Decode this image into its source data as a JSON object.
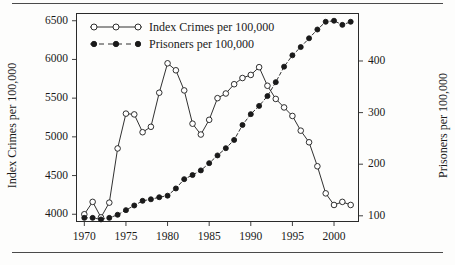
{
  "figure": {
    "has_top_rule": true,
    "has_bottom_rule": true,
    "rule_color": "#4a4a4a",
    "frame_color": "#2a2a2a"
  },
  "chart_data": {
    "type": "line",
    "title": "",
    "subtitle": "",
    "xlabel": "",
    "ylabel": "Index Crimes per 100,000",
    "ylabel_right": "Prisoners per 100,000",
    "grid": false,
    "legend_position": "top-left-inside",
    "xlim": [
      1969,
      2003
    ],
    "ylim": [
      3900,
      6600
    ],
    "ylim_right": [
      88,
      493
    ],
    "xticks": [
      1970,
      1975,
      1980,
      1985,
      1990,
      1995,
      2000
    ],
    "xtick_labels": [
      "1970",
      "1975",
      "1980",
      "1985",
      "1990",
      "1995",
      "2000"
    ],
    "yticks": [
      4000,
      4500,
      5000,
      5500,
      6000,
      6500
    ],
    "ytick_labels": [
      "4000",
      "4500",
      "5000",
      "5500",
      "6000",
      "6500"
    ],
    "yticks_right": [
      100,
      200,
      300,
      400
    ],
    "ytick_labels_right": [
      "100",
      "200",
      "300",
      "400"
    ],
    "x": [
      1970,
      1971,
      1972,
      1973,
      1974,
      1975,
      1976,
      1977,
      1978,
      1979,
      1980,
      1981,
      1982,
      1983,
      1984,
      1985,
      1986,
      1987,
      1988,
      1989,
      1990,
      1991,
      1992,
      1993,
      1994,
      1995,
      1996,
      1997,
      1998,
      1999,
      2000,
      2001,
      2002
    ],
    "series": [
      {
        "name": "Index Crimes per 100,000",
        "axis": "left",
        "marker": "open-circle",
        "line_style": "solid",
        "color": "#1a1a1a",
        "values": [
          4000,
          4160,
          3960,
          4150,
          4850,
          5300,
          5290,
          5060,
          5130,
          5570,
          5950,
          5860,
          5600,
          5170,
          5030,
          5220,
          5500,
          5560,
          5680,
          5760,
          5800,
          5900,
          5660,
          5490,
          5380,
          5270,
          5080,
          4930,
          4620,
          4270,
          4120,
          4160,
          4120
        ]
      },
      {
        "name": "Prisoners per 100,000",
        "axis": "right",
        "marker": "filled-circle",
        "line_style": "dashed",
        "color": "#1a1a1a",
        "values": [
          96,
          96,
          93,
          96,
          102,
          111,
          120,
          129,
          132,
          136,
          139,
          153,
          171,
          179,
          188,
          202,
          217,
          231,
          247,
          276,
          297,
          313,
          332,
          359,
          389,
          411,
          427,
          444,
          461,
          476,
          478,
          470,
          476
        ]
      }
    ]
  }
}
